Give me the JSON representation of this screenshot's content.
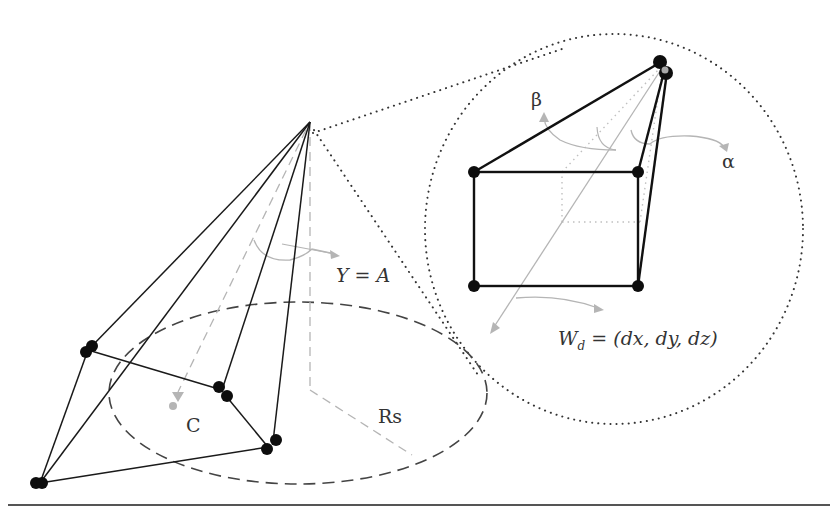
{
  "diagram": {
    "labels": {
      "y_eq_a": "Y = A",
      "c": "C",
      "rs": "Rs",
      "beta": "β",
      "alpha": "α",
      "wd_w": "W",
      "wd_sub": "d",
      "wd_rest": " = (dx, dy, dz)"
    },
    "colors": {
      "line": "#1a1a1a",
      "guide": "#b0b0b0",
      "dash": "#444444",
      "point": "#0d0d0d",
      "highlight_point": "#a8a8a8"
    }
  }
}
